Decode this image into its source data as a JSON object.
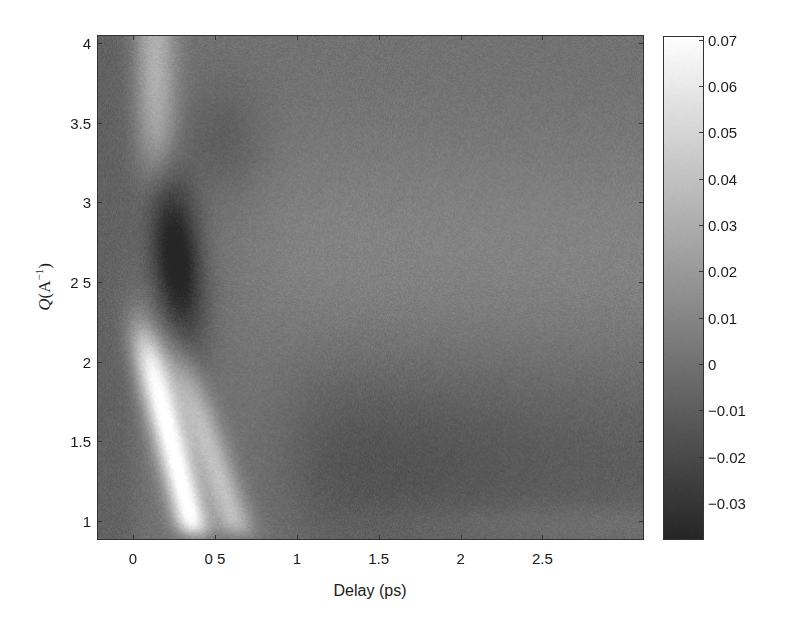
{
  "chart_data": {
    "type": "heatmap",
    "title": "",
    "xlabel": "Delay (ps)",
    "ylabel": "Q(A⁻¹)",
    "ylabel_parts": {
      "var": "Q",
      "open": "(A",
      "sup": "−1",
      "close": ")"
    },
    "xlim": [
      -0.22,
      3.12
    ],
    "ylim": [
      0.88,
      4.05
    ],
    "x_ticks": [
      0,
      0.5,
      1,
      1.5,
      2,
      2.5
    ],
    "x_tick_labels": [
      "0",
      "0 5",
      "1",
      "1.5",
      "2",
      "2.5"
    ],
    "y_ticks": [
      1,
      1.5,
      2,
      2.5,
      3,
      3.5,
      4
    ],
    "y_tick_labels": [
      "1",
      "1.5",
      "2",
      "2 5",
      "3",
      "3.5",
      "4"
    ],
    "colorbar": {
      "colormap": "gray",
      "clim": [
        -0.038,
        0.071
      ],
      "ticks": [
        0.07,
        0.06,
        0.05,
        0.04,
        0.03,
        0.02,
        0.01,
        0,
        -0.01,
        -0.02,
        -0.03
      ],
      "tick_labels": [
        "0.07",
        "0.06",
        "0.05",
        "0.04",
        "0.03",
        "0.02",
        "0.01",
        "0",
        "−0.01",
        "−0.02",
        "−0.03"
      ]
    },
    "grid": false,
    "background_value": 0.0,
    "features": [
      {
        "name": "pre-time-zero negative band",
        "type": "negative",
        "delay_range": [
          -0.22,
          0.0
        ],
        "q_range": [
          0.9,
          4.05
        ],
        "value": -0.008
      },
      {
        "name": "bright band high Q",
        "type": "positive",
        "delay_center": 0.1,
        "q_range": [
          3.3,
          4.05
        ],
        "value": 0.03
      },
      {
        "name": "dark lobe",
        "type": "negative",
        "delay_center": 0.25,
        "q_center": 2.65,
        "value": -0.035
      },
      {
        "name": "bright streak low Q (main)",
        "type": "positive",
        "delay_start": 0.1,
        "q_range": [
          0.95,
          2.2
        ],
        "value": 0.07
      },
      {
        "name": "bright streak low Q (secondary)",
        "type": "positive",
        "delay_start": 0.35,
        "q_range": [
          0.95,
          2.0
        ],
        "value": 0.04
      },
      {
        "name": "late-time negative region",
        "type": "negative",
        "delay_range": [
          1.0,
          3.1
        ],
        "q_range": [
          0.95,
          2.1
        ],
        "value": -0.015
      },
      {
        "name": "late-time positive plateau",
        "type": "positive",
        "delay_range": [
          0.8,
          3.1
        ],
        "q_range": [
          2.2,
          3.3
        ],
        "value": 0.008
      }
    ]
  }
}
